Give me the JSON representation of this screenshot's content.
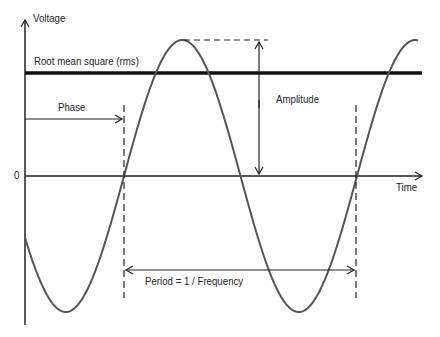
{
  "diagram": {
    "y_axis_label": "Voltage",
    "x_axis_label": "Time",
    "zero_label": "0",
    "rms_label": "Root mean square (rms)",
    "phase_label": "Phase",
    "amplitude_label": "Amplitude",
    "period_label": "Period = 1 / Frequency",
    "colors": {
      "curve": "#555555",
      "axes": "#222222",
      "rms_line": "#111111",
      "background": "#ffffff"
    }
  },
  "chart_data": {
    "type": "line",
    "title": "",
    "xlabel": "Time",
    "ylabel": "Voltage",
    "series": [
      {
        "name": "Voltage (sine wave)",
        "function": "A*sin(2*pi*(t - phase)/period)"
      }
    ],
    "annotations": [
      "Root mean square (rms)",
      "Phase",
      "Amplitude",
      "Period = 1 / Frequency"
    ],
    "y_ticks": [
      "0"
    ],
    "grid": false
  }
}
